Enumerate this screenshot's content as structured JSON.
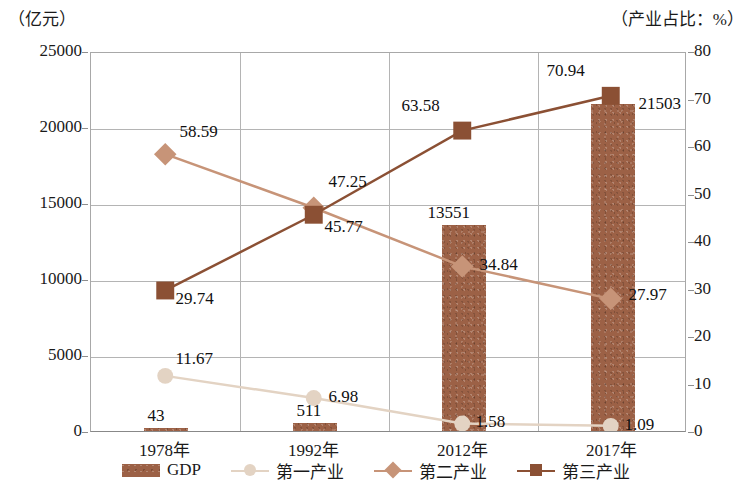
{
  "axes": {
    "left_unit": "（亿元）",
    "right_unit": "（产业占比：%）",
    "left_ticks": [
      "0",
      "5000",
      "10000",
      "15000",
      "20000",
      "25000"
    ],
    "right_ticks": [
      "0",
      "10",
      "20",
      "30",
      "40",
      "50",
      "60",
      "70",
      "80"
    ]
  },
  "legend": {
    "items": [
      {
        "label": "GDP",
        "marker": "bar-swatch",
        "color": "#9c6146"
      },
      {
        "label": "第一产业",
        "marker": "circle-marker",
        "color": "#e3d3c3"
      },
      {
        "label": "第二产业",
        "marker": "diamond-marker",
        "color": "#c79478"
      },
      {
        "label": "第三产业",
        "marker": "square-marker",
        "color": "#8b5034"
      }
    ]
  },
  "chart_data": {
    "type": "bar",
    "title": "",
    "xlabel": "",
    "ylabel": "（亿元）",
    "y2label": "（产业占比：%）",
    "categories": [
      "1978年",
      "1992年",
      "2012年",
      "2017年"
    ],
    "ylim": [
      0,
      25000
    ],
    "y2lim": [
      0,
      80
    ],
    "grid": true,
    "legend_position": "bottom",
    "series": [
      {
        "name": "GDP",
        "type": "bar",
        "axis": "left",
        "unit": "亿元",
        "color": "#9c6146",
        "values": [
          43,
          511,
          13551,
          21503
        ],
        "labels": [
          "43",
          "511",
          "13551",
          "21503"
        ]
      },
      {
        "name": "第一产业",
        "type": "line",
        "axis": "right",
        "unit": "%",
        "marker": "circle",
        "color": "#e3d3c3",
        "values": [
          11.67,
          6.98,
          1.58,
          1.09
        ],
        "labels": [
          "11.67",
          "6.98",
          "1.58",
          "1.09"
        ]
      },
      {
        "name": "第二产业",
        "type": "line",
        "axis": "right",
        "unit": "%",
        "marker": "diamond",
        "color": "#c79478",
        "values": [
          58.59,
          47.25,
          34.84,
          27.97
        ],
        "labels": [
          "58.59",
          "47.25",
          "34.84",
          "27.97"
        ]
      },
      {
        "name": "第三产业",
        "type": "line",
        "axis": "right",
        "unit": "%",
        "marker": "square",
        "color": "#8b5034",
        "values": [
          29.74,
          45.77,
          63.58,
          70.94
        ],
        "labels": [
          "29.74",
          "45.77",
          "63.58",
          "70.94"
        ]
      }
    ]
  }
}
